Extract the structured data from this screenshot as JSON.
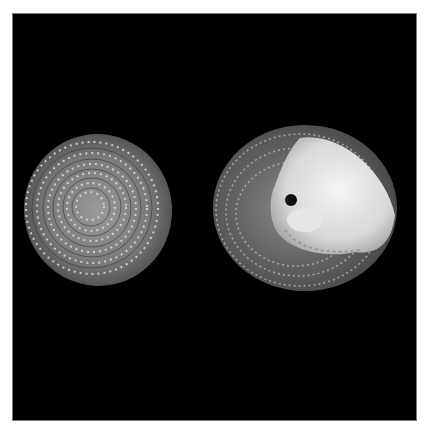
{
  "image": {
    "description": "Two sea shells photographed on a black background: left shell seen from the apex (spiral beaded pattern), right shell seen from the aperture side showing a white pearly interior",
    "background_color": "#000000",
    "frame_color": "#ffffff",
    "subjects": [
      {
        "name": "shell-apex-view",
        "position": "left"
      },
      {
        "name": "shell-aperture-view",
        "position": "right"
      }
    ]
  }
}
